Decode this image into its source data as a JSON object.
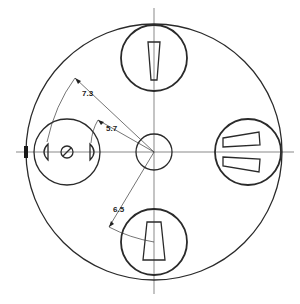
{
  "drawing": {
    "type": "technical-drawing",
    "description": "Circular plate with four circular inserts around a central hub",
    "dimensions": [
      {
        "id": "dim_outer_radius",
        "label": "7.3"
      },
      {
        "id": "dim_inner_radius",
        "label": "5.7"
      },
      {
        "id": "dim_bottom_radius",
        "label": "6.5"
      }
    ],
    "inserts": [
      {
        "position": "top",
        "feature": "single tapered slot"
      },
      {
        "position": "right",
        "feature": "two tapered slots"
      },
      {
        "position": "bottom",
        "feature": "single tapered slot"
      },
      {
        "position": "left",
        "feature": "screw head with two D-shaped cutouts"
      }
    ],
    "colors": {
      "line": "#2a2a2a",
      "background": "#ffffff"
    }
  }
}
